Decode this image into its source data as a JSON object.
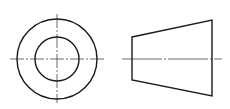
{
  "diagram": {
    "type": "orthographic-projection",
    "views": [
      {
        "name": "end-view",
        "shape": "concentric-circles",
        "center": [
          57,
          59
        ],
        "outer_radius": 40,
        "inner_radius": 22
      },
      {
        "name": "side-view",
        "shape": "frustum-trapezoid",
        "left_edge": {
          "x": 132,
          "y_top": 37,
          "y_bottom": 80
        },
        "right_edge": {
          "x": 212,
          "y_top": 20,
          "y_bottom": 96
        }
      }
    ],
    "colors": {
      "line": "#1a1a1a",
      "centerline": "#444444",
      "background": "#ffffff"
    }
  }
}
